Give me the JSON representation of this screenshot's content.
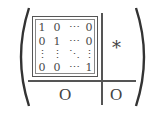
{
  "matrix": {
    "identity_block": {
      "rows": [
        [
          "1",
          "0",
          "⋯",
          "0"
        ],
        [
          "0",
          "1",
          "⋯",
          "0"
        ],
        [
          "⋮",
          "⋮",
          "⋱",
          "⋮"
        ],
        [
          "0",
          "0",
          "⋯",
          "1"
        ]
      ]
    },
    "top_right_block": "*",
    "bottom_left_block": "O",
    "bottom_right_block": "O"
  }
}
